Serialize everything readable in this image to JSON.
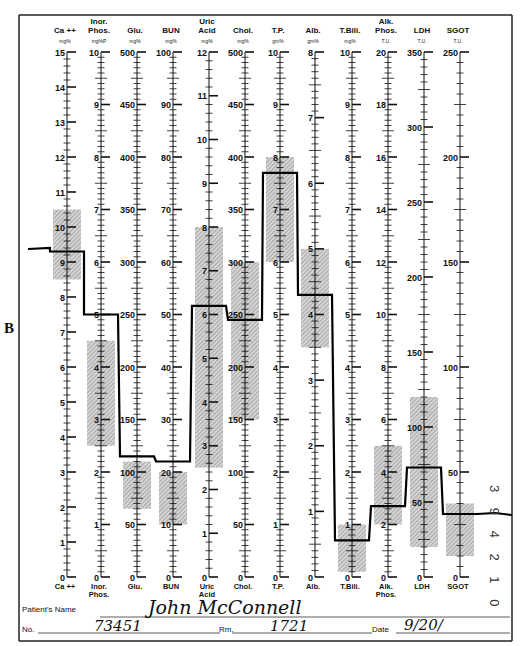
{
  "side_label": "B",
  "form": {
    "patient_name_label": "Patient's Name",
    "patient_name_value": "John McConnell",
    "no_label": "No.",
    "no_value": "73451",
    "rm_label": "Rm.",
    "rm_value": "1721",
    "date_label": "Date",
    "date_value": "9/20/"
  },
  "side_code": "3 9 4 2 1 0",
  "chart_data": {
    "type": "line",
    "legend": "shaded bands = normal ranges; heavy stepped line = patient profile",
    "grid": false,
    "columns": [
      {
        "key": "ca",
        "title": [
          "Ca ++"
        ],
        "unit": "mg%",
        "bottom": [
          "Ca ++"
        ],
        "max": 15,
        "major": 1,
        "minor": 0.2,
        "labels": [
          0,
          1,
          2,
          3,
          4,
          5,
          6,
          7,
          8,
          9,
          10,
          11,
          12,
          13,
          14,
          15
        ],
        "normal": [
          8.5,
          10.5
        ],
        "value": 9.3
      },
      {
        "key": "ip",
        "title": [
          "Inor.",
          "Phos."
        ],
        "unit": "mg%P",
        "bottom": [
          "Inor.",
          "Phos."
        ],
        "max": 10,
        "major": 1,
        "minor": 0.1,
        "labels": [
          0,
          1,
          2,
          3,
          4,
          5,
          6,
          7,
          8,
          9,
          10
        ],
        "normal": [
          2.5,
          4.5
        ],
        "value": 5.0
      },
      {
        "key": "glu",
        "title": [
          "Glu."
        ],
        "unit": "mg%",
        "bottom": [
          "Glu."
        ],
        "max": 500,
        "major": 50,
        "minor": 5,
        "labels": [
          0,
          50,
          100,
          150,
          200,
          250,
          300,
          350,
          400,
          450,
          500
        ],
        "normal": [
          65,
          110
        ],
        "value": 115
      },
      {
        "key": "bun",
        "title": [
          "BUN"
        ],
        "unit": "mg%",
        "bottom": [
          "BUN"
        ],
        "max": 100,
        "major": 10,
        "minor": 1,
        "labels": [
          0,
          10,
          20,
          30,
          40,
          50,
          60,
          70,
          80,
          90,
          100
        ],
        "normal": [
          10,
          20
        ],
        "value": 22
      },
      {
        "key": "ua",
        "title": [
          "Uric",
          "Acid"
        ],
        "unit": "mg%",
        "bottom": [
          "Uric",
          "Acid"
        ],
        "max": 12,
        "major": 1,
        "minor": 0.2,
        "labels": [
          0,
          1,
          2,
          3,
          4,
          5,
          6,
          7,
          8,
          9,
          10,
          11,
          12
        ],
        "normal": [
          2.5,
          8
        ],
        "value": 6.2
      },
      {
        "key": "chol",
        "title": [
          "Chol."
        ],
        "unit": "mg%",
        "bottom": [
          "Chol."
        ],
        "max": 500,
        "major": 50,
        "minor": 5,
        "labels": [
          0,
          50,
          100,
          150,
          200,
          250,
          300,
          350,
          400,
          450,
          500
        ],
        "normal": [
          150,
          300
        ],
        "value": 245
      },
      {
        "key": "tp",
        "title": [
          "T.P."
        ],
        "unit": "gm%",
        "bottom": [
          "T.P."
        ],
        "max": 10,
        "major": 1,
        "minor": 0.1,
        "labels": [
          0,
          1,
          2,
          3,
          4,
          5,
          6,
          7,
          8,
          9,
          10
        ],
        "normal": [
          6,
          8
        ],
        "value": 7.7
      },
      {
        "key": "alb",
        "title": [
          "Alb."
        ],
        "unit": "gm%",
        "bottom": [
          "Alb."
        ],
        "max": 8,
        "major": 1,
        "minor": 0.1,
        "labels": [
          0,
          1,
          2,
          3,
          4,
          5,
          6,
          7,
          8
        ],
        "normal": [
          3.5,
          5
        ],
        "value": 4.3
      },
      {
        "key": "tbili",
        "title": [
          "T.Bili."
        ],
        "unit": "mg%",
        "bottom": [
          "T.Bili."
        ],
        "max": 10,
        "major": 1,
        "minor": 0.1,
        "labels": [
          0,
          1,
          2,
          3,
          4,
          5,
          6,
          7,
          8,
          9,
          10
        ],
        "normal": [
          0.1,
          1.0
        ],
        "value": 0.7
      },
      {
        "key": "alk",
        "title": [
          "Alk.",
          "Phos."
        ],
        "unit": "T.U.",
        "bottom": [
          "Alk.",
          "Phos."
        ],
        "max": 20,
        "major": 2,
        "minor": 0.2,
        "labels": [
          0,
          2,
          4,
          6,
          8,
          10,
          12,
          14,
          16,
          18,
          20
        ],
        "normal": [
          2,
          5
        ],
        "value": 2.7
      },
      {
        "key": "ldh",
        "title": [
          "LDH"
        ],
        "unit": "T.U.",
        "bottom": [
          "LDH"
        ],
        "max": 350,
        "major": 50,
        "minor": 5,
        "labels": [
          0,
          50,
          100,
          150,
          200,
          250,
          300,
          350
        ],
        "normal": [
          20,
          120
        ],
        "value": 73
      },
      {
        "key": "sgot",
        "title": [
          "SGOT"
        ],
        "unit": "T.U.",
        "bottom": [
          "SGOT"
        ],
        "max": 250,
        "major": 50,
        "minor": 5,
        "labels": [
          0,
          50,
          100,
          150,
          200,
          250
        ],
        "normal": [
          10,
          35
        ],
        "value": 30
      }
    ]
  }
}
